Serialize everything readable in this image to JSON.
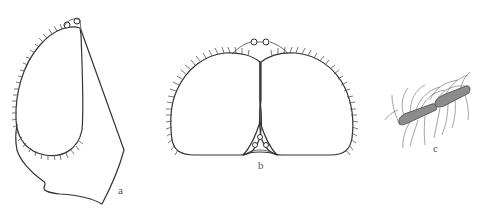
{
  "figure": {
    "background": "#ffffff",
    "stroke_color": "#333333",
    "fill_antenna": "#8a8a8a",
    "panels": [
      {
        "id": "a",
        "label": "a",
        "description": "head, lateral view"
      },
      {
        "id": "b",
        "label": "b",
        "description": "head, dorsal view"
      },
      {
        "id": "c",
        "label": "c",
        "description": "antenna"
      }
    ]
  }
}
